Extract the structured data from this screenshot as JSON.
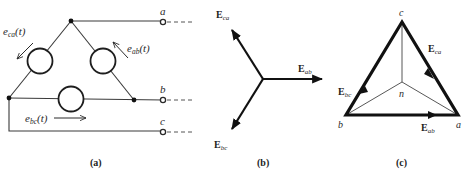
{
  "figure": {
    "panels": [
      {
        "id": "a",
        "caption": "(a)",
        "description": "Delta-connected three-phase source",
        "terminals": [
          "a",
          "b",
          "c"
        ],
        "sources": [
          {
            "name": "e_ca(t)",
            "label_main": "e",
            "label_sub": "ca",
            "label_tail": "(t)"
          },
          {
            "name": "e_ab(t)",
            "label_main": "e",
            "label_sub": "ab",
            "label_tail": "(t)"
          },
          {
            "name": "e_bc(t)",
            "label_main": "e",
            "label_sub": "bc",
            "label_tail": "(t)"
          }
        ]
      },
      {
        "id": "b",
        "caption": "(b)",
        "description": "Line voltage phasors",
        "phasors": [
          {
            "name": "E_ca",
            "label_main": "E",
            "label_sub": "ca",
            "angle_deg": 120
          },
          {
            "name": "E_ab",
            "label_main": "E",
            "label_sub": "ab",
            "angle_deg": 0
          },
          {
            "name": "E_bc",
            "label_main": "E",
            "label_sub": "bc",
            "angle_deg": -120
          }
        ]
      },
      {
        "id": "c",
        "caption": "(c)",
        "description": "Phasor triangle with neutral point",
        "vertices": [
          "a",
          "b",
          "c",
          "n"
        ],
        "edges": [
          {
            "name": "E_ca",
            "label_main": "E",
            "label_sub": "ca"
          },
          {
            "name": "E_bc",
            "label_main": "E",
            "label_sub": "bc"
          },
          {
            "name": "E_ab",
            "label_main": "E",
            "label_sub": "ab"
          }
        ]
      }
    ]
  }
}
